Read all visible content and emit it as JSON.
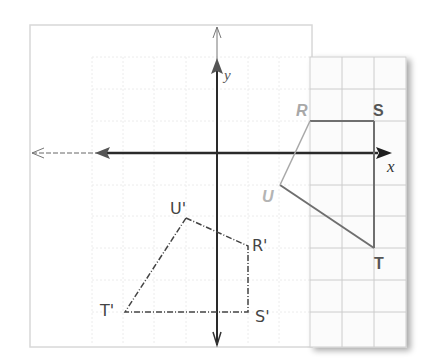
{
  "figure": {
    "axes": {
      "x_label": "x",
      "y_label": "y"
    },
    "original_figure": {
      "name": "RSTU",
      "vertices": [
        {
          "label": "R",
          "x": 3,
          "y": 1
        },
        {
          "label": "S",
          "x": 5,
          "y": 1
        },
        {
          "label": "T",
          "x": 5,
          "y": -3
        },
        {
          "label": "U",
          "x": 2,
          "y": -1
        }
      ],
      "color": "#6e6e6e",
      "label_colors": {
        "R": "#a8a8a8",
        "S": "#555555",
        "T": "#555555",
        "U": "#b4b4b4"
      }
    },
    "image_figure": {
      "name": "R'S'T'U'",
      "style": "hand-drawn dashed",
      "vertices": [
        {
          "label": "R'",
          "x": 1,
          "y": -3
        },
        {
          "label": "S'",
          "x": 1,
          "y": -5
        },
        {
          "label": "T'",
          "x": -3,
          "y": -5
        },
        {
          "label": "U'",
          "x": -1,
          "y": -2
        }
      ],
      "color": "#444444"
    },
    "colors": {
      "axis": "#2a2a2a",
      "grid_light": "#e6e6e6",
      "grid_panel": "#c8c8c8",
      "panel_border": "#cfcfcf"
    }
  }
}
